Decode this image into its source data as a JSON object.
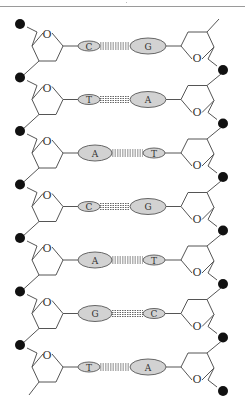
{
  "diagram": {
    "ring_oxygen_label": "O",
    "purines": [
      "A",
      "G"
    ],
    "pyrimidines": [
      "C",
      "T"
    ],
    "base_pairs": [
      {
        "left": "C",
        "right": "G"
      },
      {
        "left": "T",
        "right": "A"
      },
      {
        "left": "A",
        "right": "T"
      },
      {
        "left": "C",
        "right": "G"
      },
      {
        "left": "A",
        "right": "T"
      },
      {
        "left": "G",
        "right": "C"
      },
      {
        "left": "T",
        "right": "A"
      }
    ]
  }
}
